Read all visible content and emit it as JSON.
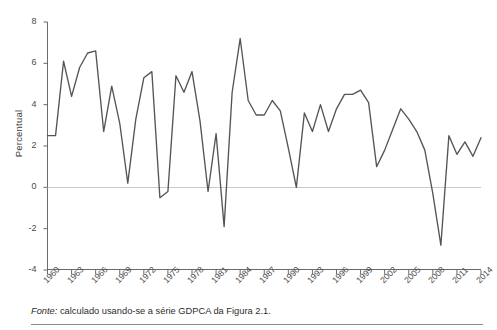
{
  "figure": {
    "y_axis_title": "Percentual",
    "footnote_label": "Fonte:",
    "footnote_text": " calculado usando-se a série GDPCA da Figura 2.1."
  },
  "chart_data": {
    "type": "line",
    "title": "",
    "xlabel": "",
    "ylabel": "Percentual",
    "ylim": [
      -4,
      8
    ],
    "xlim": [
      1960,
      2014
    ],
    "grid": false,
    "legend": null,
    "zero_line": true,
    "line_color": "#555555",
    "y_ticks": [
      8,
      6,
      4,
      2,
      0,
      -2,
      -4
    ],
    "x_ticks": [
      1960,
      1963,
      1966,
      1969,
      1972,
      1975,
      1978,
      1981,
      1984,
      1987,
      1990,
      1993,
      1996,
      1999,
      2002,
      2005,
      2008,
      2011,
      2014
    ],
    "x": [
      1960,
      1961,
      1962,
      1963,
      1964,
      1965,
      1966,
      1967,
      1968,
      1969,
      1970,
      1971,
      1972,
      1973,
      1974,
      1975,
      1976,
      1977,
      1978,
      1979,
      1980,
      1981,
      1982,
      1983,
      1984,
      1985,
      1986,
      1987,
      1988,
      1989,
      1990,
      1991,
      1992,
      1993,
      1994,
      1995,
      1996,
      1997,
      1998,
      1999,
      2000,
      2001,
      2002,
      2003,
      2004,
      2005,
      2006,
      2007,
      2008,
      2009,
      2010,
      2011,
      2012,
      2013,
      2014
    ],
    "values": [
      2.5,
      2.5,
      6.1,
      4.4,
      5.8,
      6.5,
      6.6,
      2.7,
      4.9,
      3.1,
      0.2,
      3.3,
      5.3,
      5.6,
      -0.5,
      -0.2,
      5.4,
      4.6,
      5.6,
      3.2,
      -0.2,
      2.6,
      -1.9,
      4.6,
      7.2,
      4.2,
      3.5,
      3.5,
      4.2,
      3.7,
      1.9,
      0.0,
      3.6,
      2.7,
      4.0,
      2.7,
      3.8,
      4.5,
      4.5,
      4.7,
      4.1,
      1.0,
      1.8,
      2.8,
      3.8,
      3.3,
      2.7,
      1.8,
      -0.3,
      -2.8,
      2.5,
      1.6,
      2.2,
      1.5,
      2.4
    ]
  }
}
